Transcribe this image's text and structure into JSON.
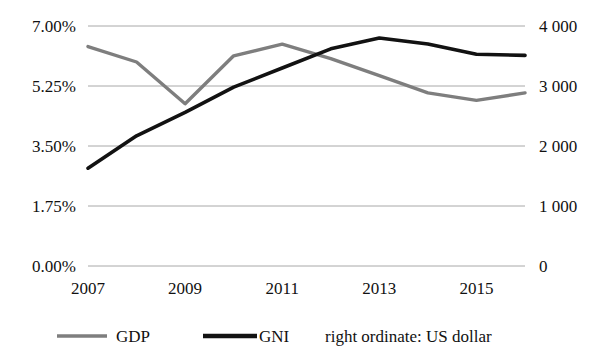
{
  "chart_data": {
    "type": "line",
    "title": "",
    "xlabel": "",
    "ylabel": "",
    "grid": true,
    "legend_position": "bottom",
    "x": [
      2007,
      2008,
      2009,
      2010,
      2011,
      2012,
      2013,
      2014,
      2015,
      2016
    ],
    "x_tick_labels": [
      "2007",
      "2009",
      "2011",
      "2013",
      "2015"
    ],
    "x_tick_values": [
      2007,
      2009,
      2011,
      2013,
      2015
    ],
    "left_axis": {
      "label": "",
      "tick_labels": [
        "0.00%",
        "1.75%",
        "3.50%",
        "5.25%",
        "7.00%"
      ],
      "tick_values": [
        0,
        1.75,
        3.5,
        5.25,
        7
      ],
      "ylim": [
        0,
        7
      ]
    },
    "right_axis": {
      "label": "right ordinate: US dollar",
      "tick_labels": [
        "0",
        "1 000",
        "2 000",
        "3 000",
        "4 000"
      ],
      "tick_values": [
        0,
        1000,
        2000,
        3000,
        4000
      ],
      "ylim": [
        0,
        4000
      ]
    },
    "series": [
      {
        "name": "GDP",
        "axis": "left",
        "unit": "%",
        "color": "#7e7e7e",
        "values": [
          6.4,
          5.95,
          4.73,
          6.13,
          6.47,
          6.05,
          5.55,
          5.05,
          4.83,
          5.05
        ]
      },
      {
        "name": "GNI",
        "axis": "right",
        "unit": "US dollar",
        "color": "#121212",
        "values": [
          1630,
          2170,
          2560,
          2980,
          3300,
          3620,
          3800,
          3700,
          3530,
          3510
        ]
      }
    ],
    "annotations": []
  },
  "legend": {
    "items": [
      {
        "label": "GDP",
        "color": "#7e7e7e"
      },
      {
        "label": "GNI",
        "color": "#121212"
      }
    ],
    "note": "right ordinate: US dollar"
  }
}
